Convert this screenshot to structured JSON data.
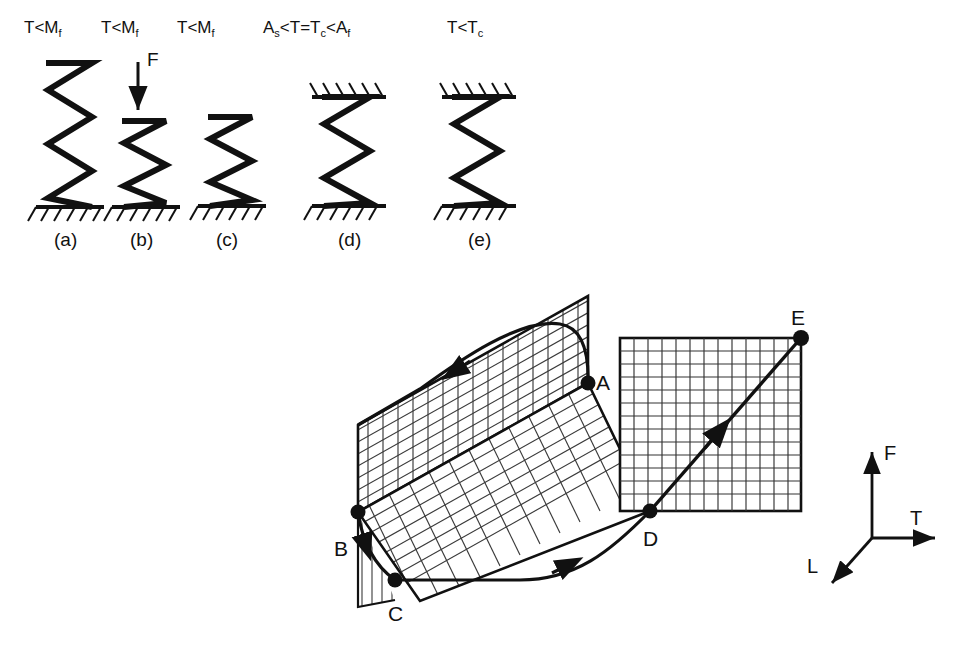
{
  "figure": {
    "top_panel": {
      "items": [
        {
          "caption": "(a)",
          "condition_main": "T<M",
          "condition_sub": "f",
          "state": "undeformed-martensite-spring",
          "ground": "bottom"
        },
        {
          "caption": "(b)",
          "condition_main": "T<M",
          "condition_sub": "f",
          "state": "compressed-spring-under-force",
          "ground": "bottom",
          "force_label": "F"
        },
        {
          "caption": "(c)",
          "condition_main": "T<M",
          "condition_sub": "f",
          "state": "residual-deformed-spring",
          "ground": "bottom"
        },
        {
          "caption": "(d)",
          "condition_main": "A",
          "condition_text": "A_s<T=T_c<A_f",
          "state": "constrained-recovery-spring",
          "ground": "both"
        },
        {
          "caption": "(e)",
          "condition_main": "T<T",
          "condition_sub": "c",
          "state": "cooled-constrained-spring",
          "ground": "both"
        }
      ],
      "condition_a": "T<M_f",
      "condition_b": "T<M_f",
      "condition_c": "T<M_f",
      "condition_d": "A_s<T=T_c<A_f",
      "condition_e": "T<T_c",
      "force_arrow_label": "F"
    },
    "bottom_panel": {
      "points": [
        {
          "id": "A",
          "label": "A"
        },
        {
          "id": "B",
          "label": "B"
        },
        {
          "id": "C",
          "label": "C"
        },
        {
          "id": "D",
          "label": "D"
        },
        {
          "id": "E",
          "label": "E"
        }
      ],
      "axes": [
        {
          "name": "F",
          "label": "F",
          "direction": "up"
        },
        {
          "name": "T",
          "label": "T",
          "direction": "right"
        },
        {
          "name": "L",
          "label": "L",
          "direction": "down-left"
        }
      ],
      "path_order": [
        "A",
        "B",
        "C",
        "D",
        "E"
      ],
      "surfaces": [
        {
          "name": "back-plane",
          "grid": "cross-hatch"
        },
        {
          "name": "floor-plane",
          "grid": "cross-hatch"
        },
        {
          "name": "right-plane",
          "grid": "square"
        }
      ]
    }
  },
  "colors": {
    "ink": "#111111",
    "grid": "#333333",
    "background": "#ffffff"
  }
}
